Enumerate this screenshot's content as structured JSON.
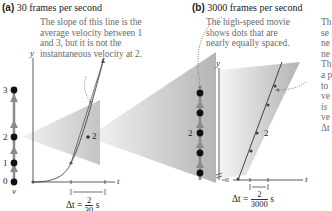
{
  "panels": [
    {
      "id": "a",
      "label": "(a)",
      "title": "30 frames per second",
      "annotation": [
        "The slope of this line is the",
        "average velocity between 1",
        "and 3, but it is not the",
        "instantaneous velocity at 2."
      ],
      "motion_diagram": {
        "dot_labels": [
          "0",
          "1",
          "2",
          "3"
        ],
        "axis_label": "v"
      },
      "graph": {
        "y_axis_label": "y",
        "t_axis_label": "t",
        "point_label": "2",
        "delta_t": {
          "prefix": "Δt =",
          "numerator": "2",
          "denominator": "30",
          "unit": "s"
        }
      }
    },
    {
      "id": "b",
      "label": "(b)",
      "title": "3000 frames per second",
      "annotation": [
        "The high-speed movie",
        "shows dots that are",
        "nearly equally spaced."
      ],
      "side_annotation_fragments": [
        "Th",
        "se",
        "ne",
        "ne",
        "Th",
        "a p",
        "to",
        "ve",
        "is",
        "ve",
        "Δt"
      ],
      "motion_diagram": {
        "dot_label": "2"
      },
      "graph": {
        "y_axis_label": "y",
        "t_axis_label": "t",
        "point_label": "2",
        "delta_t": {
          "prefix": "Δt =",
          "numerator": "2",
          "denominator": "3000",
          "unit": "s"
        }
      }
    }
  ],
  "colors": {
    "dot": "#111111",
    "arrow": "#8a8a8a",
    "cone_light": "#f2f2f2",
    "cone_dark": "#a9a9a9",
    "annotation_text": "#6b6b6b"
  }
}
